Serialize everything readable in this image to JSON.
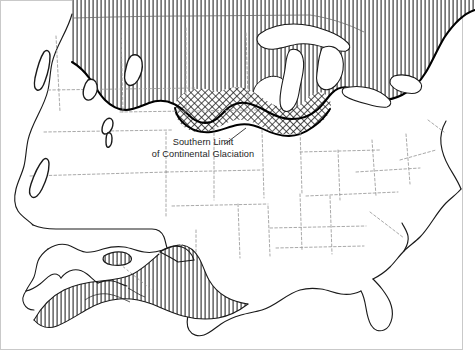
{
  "figure": {
    "kind": "thematic-map",
    "background_color": "#ffffff",
    "width": 475,
    "height": 350
  },
  "annotation": {
    "line1": "Southern Limit",
    "line2": "of Continental Glaciation",
    "text_color": "#1d1d1d",
    "leader_line": "points up and to the right toward the glacial boundary"
  },
  "legend_patterns": [
    {
      "name": "vertical-hatch",
      "meaning": "area covered by continental ice sheet",
      "stroke_color": "#2a2a2a",
      "spacing_px": 4,
      "line_width_px": 1.1
    },
    {
      "name": "cross-hatch",
      "meaning": "older / southern fringe drift belt",
      "stroke_color": "#1a1a1a",
      "cell_px": 5,
      "line_width_px": 1.0
    }
  ],
  "map_features": {
    "coastline_color": "#1a1a1a",
    "state_boundary_color": "#9a9a9a",
    "state_boundary_style": "dashed",
    "glacial_limit_color": "#000000",
    "glacial_limit_width_px": 2.1,
    "frame_border_color": "#c9c9c9"
  },
  "mountain_glaciation_areas": [
    {
      "name": "northern-cascades"
    },
    {
      "name": "sierra-nevada"
    },
    {
      "name": "bitterroot-range"
    },
    {
      "name": "wind-river-range"
    },
    {
      "name": "uinta-mountains"
    },
    {
      "name": "wasatch-range"
    }
  ],
  "great_lakes": [
    {
      "name": "lake-superior"
    },
    {
      "name": "lake-michigan"
    },
    {
      "name": "lake-huron"
    },
    {
      "name": "lake-erie"
    },
    {
      "name": "lake-ontario"
    }
  ],
  "unglaciated_enclave": {
    "name": "driftless-area"
  },
  "inset": {
    "name": "alaska-inset",
    "position": "lower-left",
    "glaciation_pattern": "vertical-hatch"
  }
}
